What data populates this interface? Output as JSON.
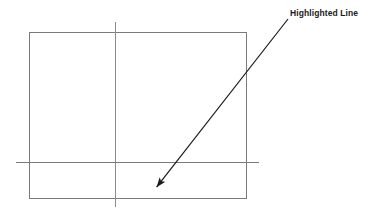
{
  "canvas": {
    "width": 372,
    "height": 217,
    "background_color": "#ffffff"
  },
  "diagram": {
    "title_text": "",
    "line_color": "#7a7a7a",
    "annotation_color": "#1a1a1a",
    "shapes": {
      "rectangle": {
        "name": "outline-rectangle",
        "x": 29,
        "y": 32,
        "width": 217,
        "height": 167,
        "stroke": "#7a7a7a",
        "stroke_width": 1,
        "fill": "none"
      },
      "vertical_line": {
        "name": "vertical-guide-line",
        "x1": 115,
        "y1": 22,
        "x2": 115,
        "y2": 207,
        "stroke": "#8a8a8a",
        "stroke_width": 1
      },
      "horizontal_line": {
        "name": "horizontal-guide-line",
        "x1": 16,
        "y1": 162,
        "x2": 259,
        "y2": 162,
        "stroke": "#7a7a7a",
        "stroke_width": 1
      }
    }
  },
  "annotation": {
    "label": "Highlighted Line",
    "label_x": 290,
    "label_y": 8,
    "arrow": {
      "name": "callout-arrow",
      "tail_x": 288,
      "tail_y": 19,
      "tip_x": 152,
      "tip_y": 193,
      "stroke": "#1a1a1a",
      "stroke_width": 1.2,
      "head_length": 12,
      "head_width": 7
    }
  }
}
